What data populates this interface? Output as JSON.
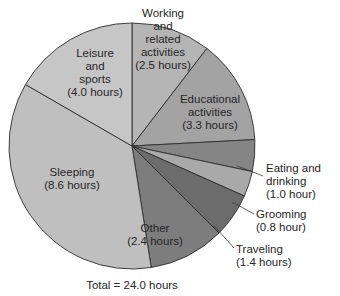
{
  "chart_data": {
    "type": "pie",
    "title": "",
    "unit": "hours",
    "start": "top",
    "direction": "clockwise",
    "slices": [
      {
        "name": "Working and related activities",
        "value": 2.5,
        "label_lines": [
          "Working",
          "and",
          "related",
          "activities",
          "(2.5 hours)"
        ],
        "color": "#b5b5b5",
        "label_position": "inside"
      },
      {
        "name": "Educational activities",
        "value": 3.3,
        "label_lines": [
          "Educational",
          "activities",
          "(3.3 hours)"
        ],
        "color": "#a3a3a3",
        "label_position": "inside"
      },
      {
        "name": "Eating and drinking",
        "value": 1.0,
        "label_lines": [
          "Eating and",
          "drinking",
          "(1.0 hour)"
        ],
        "color": "#858585",
        "label_position": "outside"
      },
      {
        "name": "Grooming",
        "value": 0.8,
        "label_lines": [
          "Grooming",
          "(0.8 hour)"
        ],
        "color": "#a9a9a9",
        "label_position": "outside"
      },
      {
        "name": "Traveling",
        "value": 1.4,
        "label_lines": [
          "Traveling",
          "(1.4 hours)"
        ],
        "color": "#6c6c6c",
        "label_position": "outside"
      },
      {
        "name": "Other",
        "value": 2.4,
        "label_lines": [
          "Other",
          "(2.4 hours)"
        ],
        "color": "#7d7d7d",
        "label_position": "inside"
      },
      {
        "name": "Sleeping",
        "value": 8.6,
        "label_lines": [
          "Sleeping",
          "(8.6 hours)"
        ],
        "color": "#bfbfbf",
        "label_position": "inside"
      },
      {
        "name": "Leisure and sports",
        "value": 4.0,
        "label_lines": [
          "Leisure",
          "and",
          "sports",
          "(4.0 hours)"
        ],
        "color": "#c6c6c6",
        "label_position": "inside"
      }
    ],
    "total_label": "Total = 24.0 hours",
    "total": 24.0
  }
}
